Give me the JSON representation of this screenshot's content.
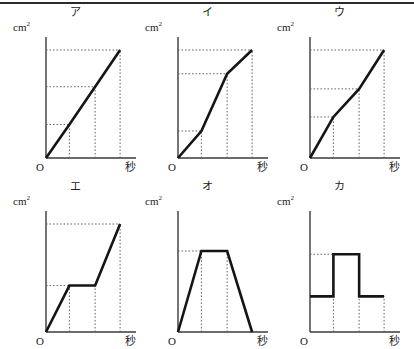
{
  "figure": {
    "y_axis_label": "cm",
    "y_axis_exponent": "2",
    "x_axis_label": "秒",
    "origin_label": "O",
    "line_color": "#151515",
    "axis_color": "#3a3a3a",
    "guide_color": "#666666",
    "background_color": "#ffffff",
    "border_color": "#2b2b2b"
  },
  "chart_data": [
    {
      "id": "a",
      "type": "line",
      "title": "ア",
      "xlabel": "秒",
      "ylabel": "cm2",
      "xlim": [
        0,
        100
      ],
      "ylim": [
        0,
        100
      ],
      "grid": false,
      "legend": "none",
      "x": [
        0,
        30,
        63,
        95
      ],
      "y": [
        0,
        31,
        66,
        100
      ],
      "guides_x": [
        30,
        63,
        95
      ],
      "guides_y": [
        31,
        66,
        100
      ],
      "note": "single straight line of constant slope from origin"
    },
    {
      "id": "b",
      "type": "line",
      "title": "イ",
      "xlabel": "秒",
      "ylabel": "cm2",
      "xlim": [
        0,
        100
      ],
      "ylim": [
        0,
        100
      ],
      "grid": false,
      "legend": "none",
      "x": [
        0,
        30,
        63,
        95
      ],
      "y": [
        0,
        25,
        78,
        100
      ],
      "guides_x": [
        30,
        63,
        95
      ],
      "guides_y": [
        25,
        78,
        100
      ],
      "note": "gentle slope, then steep slope, then gentle slope"
    },
    {
      "id": "c",
      "type": "line",
      "title": "ウ",
      "xlabel": "秒",
      "ylabel": "cm2",
      "xlim": [
        0,
        100
      ],
      "ylim": [
        0,
        100
      ],
      "grid": false,
      "legend": "none",
      "x": [
        0,
        30,
        63,
        95
      ],
      "y": [
        0,
        38,
        64,
        100
      ],
      "guides_x": [
        30,
        63,
        95
      ],
      "guides_y": [
        38,
        64,
        100
      ],
      "note": "steep, then gentler, then steep again"
    },
    {
      "id": "d",
      "type": "line",
      "title": "エ",
      "xlabel": "秒",
      "ylabel": "cm2",
      "xlim": [
        0,
        100
      ],
      "ylim": [
        0,
        100
      ],
      "grid": false,
      "legend": "none",
      "x": [
        0,
        30,
        63,
        95
      ],
      "y": [
        0,
        43,
        43,
        100
      ],
      "guides_x": [
        30,
        63,
        95
      ],
      "guides_y": [
        43,
        100
      ],
      "note": "rise, flat plateau, then rise again"
    },
    {
      "id": "e",
      "type": "line",
      "title": "オ",
      "xlabel": "秒",
      "ylabel": "cm2",
      "xlim": [
        0,
        100
      ],
      "ylim": [
        0,
        100
      ],
      "grid": false,
      "legend": "none",
      "x": [
        0,
        30,
        63,
        95
      ],
      "y": [
        0,
        75,
        75,
        0
      ],
      "guides_x": [
        30,
        63
      ],
      "guides_y": [
        75
      ],
      "note": "trapezoid: rise, plateau, fall back to zero"
    },
    {
      "id": "f",
      "type": "line",
      "title": "カ",
      "xlabel": "秒",
      "ylabel": "cm2",
      "xlim": [
        0,
        100
      ],
      "ylim": [
        0,
        100
      ],
      "grid": false,
      "legend": "none",
      "x": [
        0,
        30,
        30,
        63,
        63,
        95
      ],
      "y": [
        33,
        33,
        72,
        72,
        33,
        33
      ],
      "guides_x": [
        30,
        63,
        95
      ],
      "guides_y": [
        72
      ],
      "note": "step function: low level, high step, back to low level"
    }
  ]
}
